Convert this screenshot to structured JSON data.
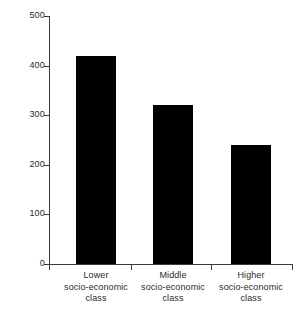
{
  "chart_data": {
    "type": "bar",
    "title": "",
    "subtitle": "",
    "xlabel": "",
    "ylabel": "",
    "categories": [
      "Lower socio-economic class",
      "Middle socio-economic class",
      "Higher socio-economic class"
    ],
    "category_lines": [
      [
        "Lower",
        "socio-economic",
        "class"
      ],
      [
        "Middle",
        "socio-economic",
        "class"
      ],
      [
        "Higher",
        "socio-economic",
        "class"
      ]
    ],
    "values": [
      420,
      320,
      240
    ],
    "ylim": [
      0,
      500
    ],
    "y_ticks": [
      0,
      100,
      200,
      300,
      400,
      500
    ],
    "y_tick_labels": [
      "0",
      "100",
      "200",
      "300",
      "400",
      "500"
    ],
    "x_ticks_positions": [
      "axis-start",
      "group-1-2-boundary",
      "group-2-3-boundary",
      "axis-end"
    ],
    "grid": false,
    "legend": false,
    "legend_position": "none",
    "bar_color": "#000000",
    "axis_color": "#3a3a3a",
    "background_color": "#ffffff",
    "annotations": []
  },
  "figure": {
    "plot_area": {
      "left_px": 49,
      "right_px": 293,
      "top_px": 16,
      "baseline_px": 264
    },
    "bars": [
      {
        "label": "Lower",
        "value": 420,
        "left_px": 76,
        "width_px": 40
      },
      {
        "label": "Middle",
        "value": 320,
        "left_px": 153,
        "width_px": 40
      },
      {
        "label": "Higher",
        "value": 240,
        "left_px": 231,
        "width_px": 40
      }
    ],
    "x_tick_px": [
      49,
      131,
      211,
      292
    ],
    "category_centers_px": [
      96,
      173,
      251
    ]
  }
}
